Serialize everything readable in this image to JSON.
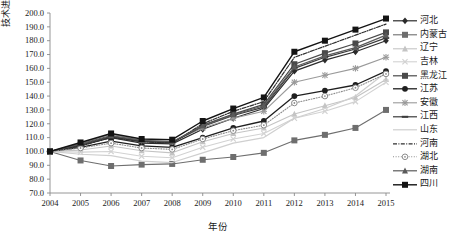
{
  "chart_data": {
    "type": "line",
    "title": "",
    "xlabel": "年份",
    "ylabel": "技术进步(%)",
    "x": [
      2004,
      2005,
      2006,
      2007,
      2008,
      2009,
      2010,
      2011,
      2012,
      2013,
      2014,
      2015
    ],
    "xtick_labels": [
      "2004",
      "2005",
      "2006",
      "2007",
      "2008",
      "2009",
      "2010",
      "2011",
      "2012",
      "2013",
      "2014",
      "2015"
    ],
    "ytick_labels": [
      "200.0",
      "190.0",
      "180.0",
      "170.0",
      "160.0",
      "150.0",
      "140.0",
      "130.0",
      "120.0",
      "110.0",
      "100.0",
      "90.0",
      "80.0",
      "70.0"
    ],
    "ylim": [
      70,
      200
    ],
    "xlim": [
      2004,
      2015
    ],
    "ytick_step": 10,
    "grid": false,
    "legend_position": "right",
    "series": [
      {
        "name": "河北",
        "color": "#2b2b2b",
        "marker": "diamond",
        "dash": "solid",
        "width": 1.2,
        "values": [
          100.0,
          104.5,
          110.0,
          106.0,
          105.5,
          116.0,
          124.0,
          131.0,
          158.0,
          166.0,
          172.0,
          180.0
        ]
      },
      {
        "name": "内蒙古",
        "color": "#6e6e6e",
        "marker": "square",
        "dash": "solid",
        "width": 1.1,
        "values": [
          100.0,
          93.5,
          89.5,
          90.5,
          91.0,
          94.0,
          96.0,
          99.0,
          108.0,
          112.0,
          117.0,
          130.0
        ]
      },
      {
        "name": "辽宁",
        "color": "#c4c4c4",
        "marker": "triangle",
        "dash": "solid",
        "width": 1.1,
        "values": [
          100.0,
          101.0,
          104.0,
          100.5,
          99.0,
          107.0,
          113.0,
          117.0,
          127.0,
          133.0,
          139.0,
          152.0
        ]
      },
      {
        "name": "吉林",
        "color": "#d2d2d2",
        "marker": "cross",
        "dash": "solid",
        "width": 1.1,
        "values": [
          100.0,
          99.5,
          100.0,
          96.5,
          95.5,
          103.0,
          109.0,
          113.0,
          124.0,
          129.0,
          136.0,
          150.0
        ]
      },
      {
        "name": "黑龙江",
        "color": "#4a4a4a",
        "marker": "square",
        "dash": "solid",
        "width": 1.2,
        "values": [
          100.0,
          104.0,
          110.5,
          107.0,
          106.5,
          119.0,
          127.0,
          134.0,
          163.0,
          171.0,
          178.0,
          186.0
        ]
      },
      {
        "name": "江苏",
        "color": "#1f1f1f",
        "marker": "circle",
        "dash": "solid",
        "width": 1.3,
        "values": [
          100.0,
          103.0,
          107.5,
          104.0,
          103.0,
          110.0,
          117.0,
          122.0,
          140.0,
          144.0,
          148.0,
          158.0
        ]
      },
      {
        "name": "安徽",
        "color": "#9a9a9a",
        "marker": "star",
        "dash": "solid",
        "width": 1.1,
        "values": [
          100.0,
          106.0,
          112.5,
          108.0,
          107.0,
          117.0,
          124.0,
          129.0,
          150.0,
          155.0,
          160.0,
          168.0
        ]
      },
      {
        "name": "江西",
        "color": "#3a3a3a",
        "marker": "dash",
        "dash": "solid",
        "width": 1.2,
        "values": [
          100.0,
          105.0,
          111.0,
          107.5,
          106.5,
          118.0,
          126.0,
          132.0,
          160.0,
          168.0,
          174.0,
          182.0
        ]
      },
      {
        "name": "山东",
        "color": "#cfcfcf",
        "marker": "none",
        "dash": "solid",
        "width": 1.2,
        "values": [
          100.0,
          98.0,
          97.0,
          93.0,
          92.0,
          99.0,
          106.0,
          110.0,
          124.0,
          131.0,
          140.0,
          157.0
        ]
      },
      {
        "name": "河南",
        "color": "#2f2f2f",
        "marker": "none",
        "dash": "dashdot",
        "width": 1.2,
        "values": [
          100.0,
          104.0,
          110.0,
          107.0,
          106.0,
          120.0,
          129.0,
          136.0,
          168.0,
          176.0,
          184.0,
          192.0
        ]
      },
      {
        "name": "湖北",
        "color": "#8c8c8c",
        "marker": "opencircle",
        "dash": "dotted",
        "width": 1.1,
        "values": [
          100.0,
          102.5,
          106.0,
          102.5,
          101.5,
          109.0,
          115.0,
          119.0,
          135.0,
          140.0,
          146.0,
          156.0
        ]
      },
      {
        "name": "湖南",
        "color": "#5a5a5a",
        "marker": "triangle",
        "dash": "solid",
        "width": 1.2,
        "values": [
          100.0,
          105.5,
          111.5,
          108.0,
          107.0,
          118.5,
          126.5,
          133.0,
          161.0,
          169.0,
          175.0,
          184.0
        ]
      },
      {
        "name": "四川",
        "color": "#141414",
        "marker": "square",
        "dash": "solid",
        "width": 1.4,
        "values": [
          100.0,
          106.5,
          113.0,
          109.0,
          108.5,
          122.0,
          131.0,
          139.0,
          172.0,
          180.0,
          188.0,
          196.0
        ]
      }
    ]
  }
}
